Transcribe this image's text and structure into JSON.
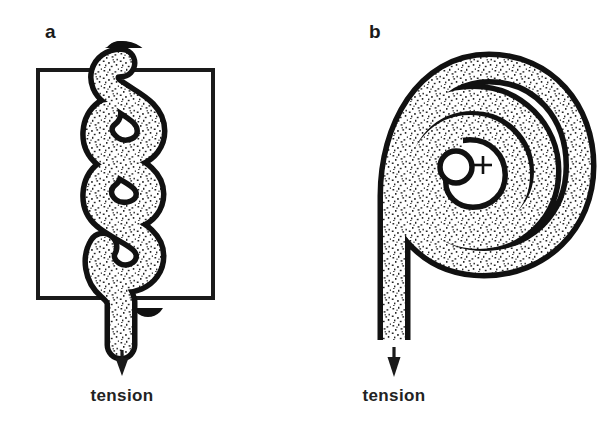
{
  "figure": {
    "background_color": "#ffffff",
    "ink_color": "#111111",
    "stipple_color": "#2a2a2a",
    "width": 600,
    "height": 427
  },
  "panels": [
    {
      "id": "a",
      "letter": "a",
      "letter_x": 45,
      "letter_y": 38,
      "description": "wavy serpentine fiber crossing a rectangular boundary under tension",
      "box": {
        "x": 38,
        "y": 70,
        "width": 175,
        "height": 228
      },
      "strand": {
        "type": "serpentine",
        "band_thickness": 23,
        "outline_width": 5.5,
        "lobes": 5,
        "x_center": 123,
        "amplitude": 26,
        "y_start": 62,
        "y_end": 298
      },
      "tail": {
        "x": 111,
        "y_top": 298,
        "y_bottom": 343
      },
      "arrow": {
        "x": 122,
        "y_top": 348,
        "y_bottom": 374,
        "head_width": 13,
        "head_length": 15
      },
      "label": {
        "text": "tension",
        "x": 122,
        "y": 400
      }
    },
    {
      "id": "b",
      "letter": "b",
      "letter_x": 369,
      "letter_y": 38,
      "description": "same fiber coiled into a spiral of about two and a half turns with a plus mark at the core",
      "spiral": {
        "type": "archimedean",
        "center_x": 478,
        "center_y": 165,
        "turns": 2.45,
        "r_start": 26,
        "r_end": 101,
        "band_thickness": 22,
        "outline_width": 5.5
      },
      "core": {
        "small_circle_x": 455,
        "small_circle_y": 166,
        "small_circle_r": 15,
        "plus_x": 483,
        "plus_y": 165,
        "plus_size": 9
      },
      "tail": {
        "x": 394,
        "y_top": 165,
        "y_bottom": 340
      },
      "arrow": {
        "x": 394,
        "y_top": 345,
        "y_bottom": 374,
        "head_width": 13,
        "head_length": 15
      },
      "label": {
        "text": "tension",
        "x": 394,
        "y": 400
      }
    }
  ]
}
